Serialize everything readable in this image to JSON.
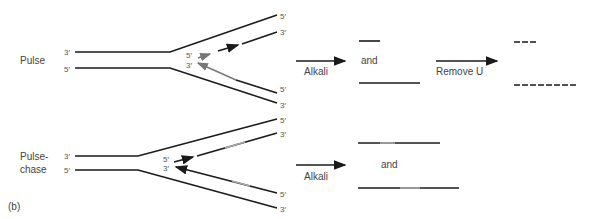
{
  "panel_label": "(b)",
  "rows": {
    "pulse": {
      "label": "Pulse",
      "ends": {
        "left_top": "3′",
        "left_bottom": "5′",
        "right_1": "5′",
        "right_2": "3′",
        "right_3": "5′",
        "right_4": "3′",
        "fork_top": "5′",
        "fork_bottom": "3′"
      },
      "step1_label": "Alkali",
      "and_label": "and",
      "step2_label": "Remove U"
    },
    "pulse_chase": {
      "label_line1": "Pulse-",
      "label_line2": "chase",
      "ends": {
        "left_top": "3′",
        "left_bottom": "5′",
        "right_1": "5′",
        "right_2": "3′",
        "right_3": "5′",
        "right_4": "3′",
        "fork_top": "5′",
        "fork_bottom": "3′"
      },
      "step1_label": "Alkali",
      "and_label": "and"
    }
  }
}
